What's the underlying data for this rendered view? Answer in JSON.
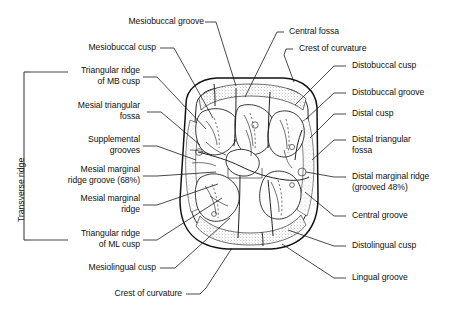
{
  "figure": {
    "type": "anatomical-line-drawing"
  },
  "bracket": {
    "label": "Transverse ridge"
  },
  "labels_left": [
    {
      "id": "mesiobuccal-cusp",
      "text": "Mesiobuccal cusp"
    },
    {
      "id": "triangular-ridge-mb",
      "text": "Triangular ridge\nof MB cusp"
    },
    {
      "id": "mesial-triangular-fossa",
      "text": "Mesial triangular\nfossa"
    },
    {
      "id": "supplemental-grooves",
      "text": "Supplemental\ngrooves"
    },
    {
      "id": "mesial-marginal-ridge-groove",
      "text": "Mesial marginal\nridge groove (68%)"
    },
    {
      "id": "mesial-marginal-ridge",
      "text": "Mesial marginal\nridge"
    },
    {
      "id": "triangular-ridge-ml",
      "text": "Triangular ridge\nof ML cusp"
    },
    {
      "id": "mesiolingual-cusp",
      "text": "Mesiolingual cusp"
    }
  ],
  "labels_top": [
    {
      "id": "mesiobuccal-groove",
      "text": "Mesiobuccal groove"
    },
    {
      "id": "central-fossa",
      "text": "Central fossa"
    },
    {
      "id": "crest-of-curvature-top",
      "text": "Crest of curvature"
    }
  ],
  "labels_right": [
    {
      "id": "distobuccal-cusp",
      "text": "Distobuccal cusp"
    },
    {
      "id": "distobuccal-groove",
      "text": "Distobuccal groove"
    },
    {
      "id": "distal-cusp",
      "text": "Distal cusp"
    },
    {
      "id": "distal-triangular-fossa",
      "text": "Distal triangular\nfossa"
    },
    {
      "id": "distal-marginal-ridge",
      "text": "Distal marginal ridge\n(grooved 48%)"
    },
    {
      "id": "central-groove",
      "text": "Central groove"
    },
    {
      "id": "distolingual-cusp",
      "text": "Distolingual cusp"
    },
    {
      "id": "lingual-groove",
      "text": "Lingual groove"
    }
  ],
  "labels_bottom": [
    {
      "id": "crest-of-curvature-bottom",
      "text": "Crest of curvature"
    }
  ],
  "colors": {
    "ink": "#111111",
    "paper": "#ffffff",
    "stipple": "#7a7a7a"
  }
}
